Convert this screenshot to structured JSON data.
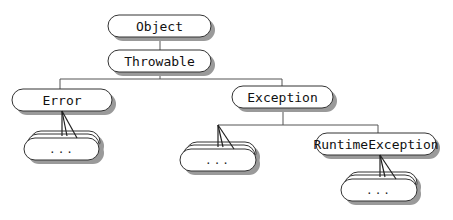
{
  "diagram": {
    "colors": {
      "node_fill": "#ffffff",
      "node_stroke": "#333333",
      "shadow": "#9a9a9a",
      "connector": "#555555",
      "fan_line": "#222222"
    },
    "nodes": {
      "object": {
        "label": "Object",
        "x": 108,
        "y": 15,
        "w": 103,
        "h": 22
      },
      "throwable": {
        "label": "Throwable",
        "x": 108,
        "y": 50,
        "w": 103,
        "h": 22
      },
      "error": {
        "label": "Error",
        "x": 12,
        "y": 89,
        "w": 100,
        "h": 22
      },
      "exception": {
        "label": "Exception",
        "x": 232,
        "y": 86,
        "w": 101,
        "h": 22
      },
      "runtime": {
        "label": "RuntimeException",
        "x": 316,
        "y": 133,
        "w": 120,
        "h": 22
      }
    },
    "stacks": {
      "error_subclasses": {
        "label": "...",
        "x": 24,
        "y": 131
      },
      "exception_subclasses": {
        "label": "...",
        "x": 180,
        "y": 142
      },
      "runtime_subclasses": {
        "label": "...",
        "x": 341,
        "y": 172
      }
    }
  }
}
